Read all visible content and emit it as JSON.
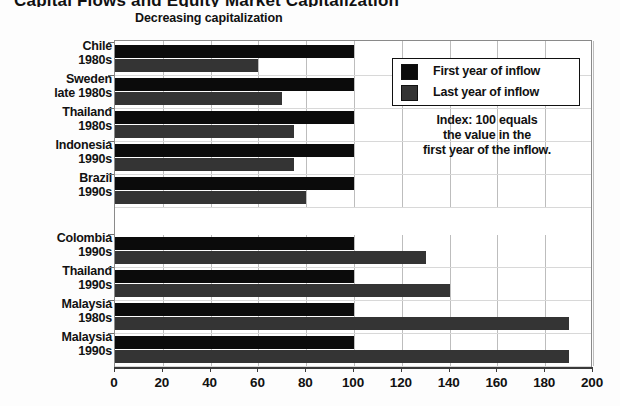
{
  "headline": "Capital Flows and Equity Market Capitalization",
  "sections": {
    "decreasing_label": "Decreasing capitalization",
    "increasing_label": "Increasing capitalization"
  },
  "legend": {
    "items": [
      {
        "label": "First year of inflow",
        "color": "#0b0b0b",
        "key": "first"
      },
      {
        "label": "Last year of inflow",
        "color": "#343434",
        "key": "last"
      }
    ]
  },
  "note": {
    "line1": "Index: 100 equals",
    "line2": "the value in the",
    "line3": "first year of the inflow."
  },
  "chart_data": {
    "type": "bar",
    "orientation": "horizontal",
    "title": "Capital Flows and Equity Market Capitalization",
    "xlabel": "",
    "ylabel": "",
    "xlim": [
      0,
      200
    ],
    "xticks": [
      0,
      20,
      40,
      60,
      80,
      100,
      120,
      140,
      160,
      180,
      200
    ],
    "xtick_labels": [
      "0",
      "20",
      "40",
      "60",
      "80",
      "100",
      "120",
      "140",
      "160",
      "180",
      "200"
    ],
    "grid": "vertical",
    "legend_position": "upper-right-inside",
    "annotation": "Index: 100 equals the value in the first year of the inflow.",
    "groups": [
      {
        "name": "Decreasing capitalization",
        "categories": [
          {
            "country": "Chile",
            "period": "1980s"
          },
          {
            "country": "Sweden",
            "period": "late 1980s"
          },
          {
            "country": "Thailand",
            "period": "1980s"
          },
          {
            "country": "Indonesia",
            "period": "1990s"
          },
          {
            "country": "Brazil",
            "period": "1990s"
          }
        ],
        "series": [
          {
            "name": "First year of inflow",
            "values": [
              100,
              100,
              100,
              100,
              100
            ]
          },
          {
            "name": "Last year of inflow",
            "values": [
              60,
              70,
              75,
              75,
              80
            ]
          }
        ]
      },
      {
        "name": "Increasing capitalization",
        "categories": [
          {
            "country": "Colombia",
            "period": "1990s"
          },
          {
            "country": "Thailand",
            "period": "1990s"
          },
          {
            "country": "Malaysia",
            "period": "1980s"
          },
          {
            "country": "Malaysia",
            "period": "1990s"
          }
        ],
        "series": [
          {
            "name": "First year of inflow",
            "values": [
              100,
              100,
              100,
              100
            ]
          },
          {
            "name": "Last year of inflow",
            "values": [
              130,
              140,
              190,
              190
            ]
          }
        ]
      }
    ]
  }
}
